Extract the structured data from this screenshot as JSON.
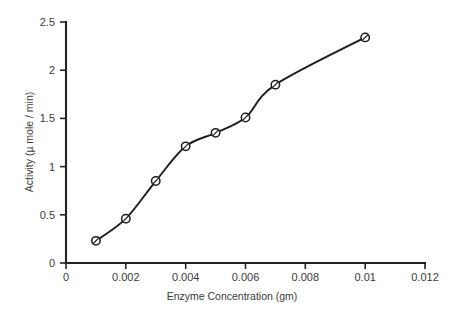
{
  "chart_data": {
    "type": "line",
    "title": "",
    "subtitle": "",
    "xlabel": "Enzyme Concentration (gm)",
    "ylabel": "Activity (µ mole / min)",
    "x": [
      0.001,
      0.002,
      0.003,
      0.004,
      0.005,
      0.006,
      0.007,
      0.01
    ],
    "values": [
      0.23,
      0.46,
      0.85,
      1.21,
      1.35,
      1.51,
      1.85,
      2.34
    ],
    "series": [
      {
        "name": "Activity",
        "values": [
          0.23,
          0.46,
          0.85,
          1.21,
          1.35,
          1.51,
          1.85,
          2.34
        ]
      }
    ],
    "xlim": [
      0,
      0.012
    ],
    "ylim": [
      0,
      2.5
    ],
    "xticks": [
      0,
      0.002,
      0.004,
      0.006,
      0.008,
      0.01,
      0.012
    ],
    "xticklabels": [
      "0",
      "0.002",
      "0.004",
      "0.006",
      "0.008",
      "0.01",
      "0.012"
    ],
    "yticks": [
      0,
      0.5,
      1,
      1.5,
      2,
      2.5
    ],
    "yticklabels": [
      "0",
      "0.5",
      "1",
      "1.5",
      "2",
      "2.5"
    ],
    "grid": false,
    "legend": null,
    "legend_position": "none",
    "marker": "open-circle",
    "line_color": "#1c1c1c",
    "marker_fill": "#ffffff",
    "background": "#ffffff",
    "annotations": []
  }
}
